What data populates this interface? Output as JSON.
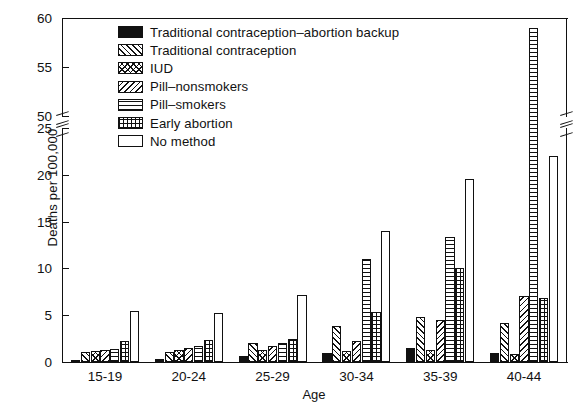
{
  "chart_data": {
    "type": "bar",
    "title": "",
    "xlabel": "Age",
    "ylabel": "Deaths per 100,000",
    "categories": [
      "15-19",
      "20-24",
      "25-29",
      "30-34",
      "35-39",
      "40-44"
    ],
    "ylim": [
      0,
      60
    ],
    "y_ticks_lower": [
      0,
      5,
      10,
      15,
      20,
      25
    ],
    "y_ticks_upper": [
      50,
      55,
      60
    ],
    "axis_break": {
      "between": [
        25,
        50
      ],
      "note": "broken y-axis"
    },
    "grid": false,
    "legend_position": "top-left inside plot",
    "series": [
      {
        "name": "Traditional contraception–abortion backup",
        "pattern": "solid-black",
        "values": [
          0.2,
          0.3,
          0.6,
          1.0,
          1.5,
          1.0
        ]
      },
      {
        "name": "Traditional contraception",
        "pattern": "diagonal-hatch",
        "values": [
          1.1,
          1.1,
          2.0,
          3.8,
          4.8,
          4.2
        ]
      },
      {
        "name": "IUD",
        "pattern": "cross-hatch",
        "values": [
          1.2,
          1.3,
          1.3,
          1.2,
          1.3,
          0.9
        ]
      },
      {
        "name": "Pill–nonsmokers",
        "pattern": "reverse-diagonal-hatch",
        "values": [
          1.3,
          1.5,
          1.7,
          2.2,
          4.5,
          7.0
        ]
      },
      {
        "name": "Pill–smokers",
        "pattern": "horizontal-lines",
        "values": [
          1.4,
          1.7,
          2.0,
          11.0,
          13.4,
          59.0
        ]
      },
      {
        "name": "Early abortion",
        "pattern": "fine-grid",
        "values": [
          2.2,
          2.3,
          2.5,
          5.3,
          10.0,
          6.8
        ]
      },
      {
        "name": "No method",
        "pattern": "empty-white",
        "values": [
          5.5,
          5.2,
          7.2,
          14.0,
          19.5,
          22.0
        ]
      }
    ]
  },
  "legend": {
    "items": [
      {
        "label": "Traditional contraception–abortion backup",
        "pattern": "solid-black"
      },
      {
        "label": "Traditional contraception",
        "pattern": "diagonal-hatch"
      },
      {
        "label": "IUD",
        "pattern": "cross-hatch"
      },
      {
        "label": "Pill–nonsmokers",
        "pattern": "reverse-diagonal-hatch"
      },
      {
        "label": "Pill–smokers",
        "pattern": "horizontal-lines"
      },
      {
        "label": "Early abortion",
        "pattern": "fine-grid"
      },
      {
        "label": "No method",
        "pattern": "empty-white"
      }
    ]
  },
  "axes": {
    "y_title": "Deaths per 100,000",
    "x_title": "Age",
    "y_tick_labels": [
      "60",
      "55",
      "50",
      "25",
      "20",
      "15",
      "10",
      "5",
      "0"
    ],
    "x_tick_labels": [
      "15-19",
      "20-24",
      "25-29",
      "30-34",
      "35-39",
      "40-44"
    ]
  },
  "colors": {
    "ink": "#111111",
    "paper": "#ffffff"
  }
}
